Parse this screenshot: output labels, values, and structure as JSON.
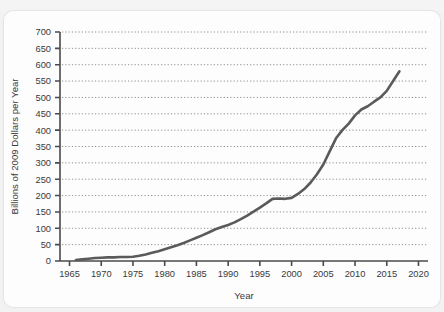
{
  "chart_data": {
    "type": "line",
    "title": "",
    "xlabel": "Year",
    "ylabel": "Billions of 2009 Dollars per Year",
    "xlim": [
      1963.5,
      2021.5
    ],
    "ylim": [
      0,
      700
    ],
    "xticks": [
      1965,
      1970,
      1975,
      1980,
      1985,
      1990,
      1995,
      2000,
      2005,
      2010,
      2015,
      2020
    ],
    "yticks": [
      0,
      50,
      100,
      150,
      200,
      250,
      300,
      350,
      400,
      450,
      500,
      550,
      600,
      650,
      700
    ],
    "grid": "horizontal-dotted",
    "legend": "none",
    "line_color": "#555555",
    "x": [
      1966,
      1967,
      1968,
      1969,
      1970,
      1971,
      1972,
      1973,
      1974,
      1975,
      1976,
      1977,
      1978,
      1979,
      1980,
      1981,
      1982,
      1983,
      1984,
      1985,
      1986,
      1987,
      1988,
      1989,
      1990,
      1991,
      1992,
      1993,
      1994,
      1995,
      1996,
      1997,
      1998,
      1999,
      2000,
      2001,
      2002,
      2003,
      2004,
      2005,
      2006,
      2007,
      2008,
      2009,
      2010,
      2011,
      2012,
      2013,
      2014,
      2015,
      2016,
      2017
    ],
    "values": [
      3,
      5,
      7,
      9,
      10,
      11,
      11,
      12,
      12,
      13,
      16,
      20,
      25,
      30,
      36,
      42,
      48,
      55,
      63,
      71,
      79,
      88,
      97,
      104,
      110,
      118,
      128,
      139,
      151,
      163,
      176,
      190,
      191,
      190,
      193,
      205,
      220,
      240,
      265,
      295,
      335,
      375,
      400,
      420,
      445,
      463,
      473,
      487,
      500,
      520,
      550,
      580
    ]
  },
  "axis": {
    "y_tick_labels": [
      "700",
      "650",
      "600",
      "550",
      "500",
      "450",
      "400",
      "350",
      "300",
      "250",
      "200",
      "150",
      "100",
      "50",
      "0"
    ],
    "x_tick_labels": [
      "1965",
      "1970",
      "1975",
      "1980",
      "1985",
      "1990",
      "1995",
      "2000",
      "2005",
      "2010",
      "2015",
      "2020"
    ],
    "y_title": "Billions of 2009 Dollars per Year",
    "x_title": "Year"
  },
  "artifact": {
    "top_ghost_text": ""
  }
}
